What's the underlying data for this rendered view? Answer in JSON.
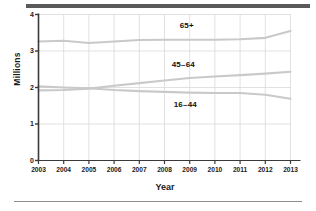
{
  "figure": {
    "ylabel": "Millions",
    "xlabel": "Year",
    "decor": {
      "top_rule_color": "#5a5a5a",
      "bottom_rule_color": "#8f8f8f",
      "line_color": "#c9c9c9",
      "grid_color": "#d9d9d9",
      "axis_color": "#3a3a3a",
      "text_color": "#1a1a1a",
      "background": "#ffffff"
    },
    "yticks": [
      "0",
      "1",
      "2",
      "3",
      "4"
    ],
    "xticks": [
      "2003",
      "2004",
      "2005",
      "2006",
      "2007",
      "2008",
      "2009",
      "2010",
      "2011",
      "2012",
      "2013"
    ],
    "series_labels": {
      "older": "65+",
      "middle": "45–64",
      "younger": "16–44"
    }
  },
  "chart_data": {
    "type": "line",
    "title": "",
    "xlabel": "Year",
    "ylabel": "Millions",
    "x": [
      2003,
      2004,
      2005,
      2006,
      2007,
      2008,
      2009,
      2010,
      2011,
      2012,
      2013
    ],
    "xlim": [
      2003,
      2013
    ],
    "ylim": [
      0,
      4
    ],
    "yticks": [
      0,
      1,
      2,
      3,
      4
    ],
    "grid": true,
    "legend": "inline-annotations",
    "series": [
      {
        "name": "65+",
        "values": [
          3.26,
          3.28,
          3.22,
          3.26,
          3.3,
          3.31,
          3.31,
          3.31,
          3.32,
          3.36,
          3.55
        ],
        "label_position": "above-line"
      },
      {
        "name": "45–64",
        "values": [
          1.92,
          1.93,
          1.97,
          2.05,
          2.12,
          2.19,
          2.26,
          2.3,
          2.34,
          2.38,
          2.43
        ],
        "label_position": "above-line"
      },
      {
        "name": "16–44",
        "values": [
          2.03,
          2.0,
          1.98,
          1.93,
          1.9,
          1.88,
          1.86,
          1.85,
          1.85,
          1.8,
          1.69
        ],
        "label_position": "below-line"
      }
    ]
  }
}
